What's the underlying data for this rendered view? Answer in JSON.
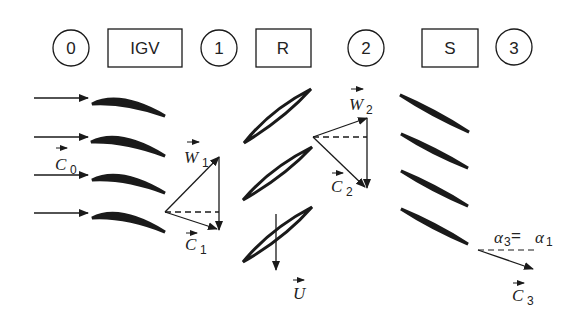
{
  "stations": [
    {
      "id": "station-0",
      "label": "0",
      "shape": "circle"
    },
    {
      "id": "igv",
      "label": "IGV",
      "shape": "box"
    },
    {
      "id": "station-1",
      "label": "1",
      "shape": "circle"
    },
    {
      "id": "rotor",
      "label": "R",
      "shape": "box"
    },
    {
      "id": "station-2",
      "label": "2",
      "shape": "circle"
    },
    {
      "id": "stator",
      "label": "S",
      "shape": "box"
    },
    {
      "id": "station-3",
      "label": "3",
      "shape": "circle"
    }
  ],
  "vectors": {
    "c0": {
      "symbol": "C",
      "sub": "0"
    },
    "w1": {
      "symbol": "W",
      "sub": "1"
    },
    "c1": {
      "symbol": "C",
      "sub": "1"
    },
    "w2": {
      "symbol": "W",
      "sub": "2"
    },
    "c2": {
      "symbol": "C",
      "sub": "2"
    },
    "u": {
      "symbol": "U",
      "sub": ""
    },
    "c3": {
      "symbol": "C",
      "sub": "3"
    }
  },
  "annotations": {
    "angle_relation": {
      "alpha_left": "α",
      "sub_left": "3",
      "equals": " = ",
      "alpha_right": "α",
      "sub_right": "1"
    }
  },
  "colors": {
    "ink": "#1a1a1a",
    "background": "#ffffff"
  }
}
